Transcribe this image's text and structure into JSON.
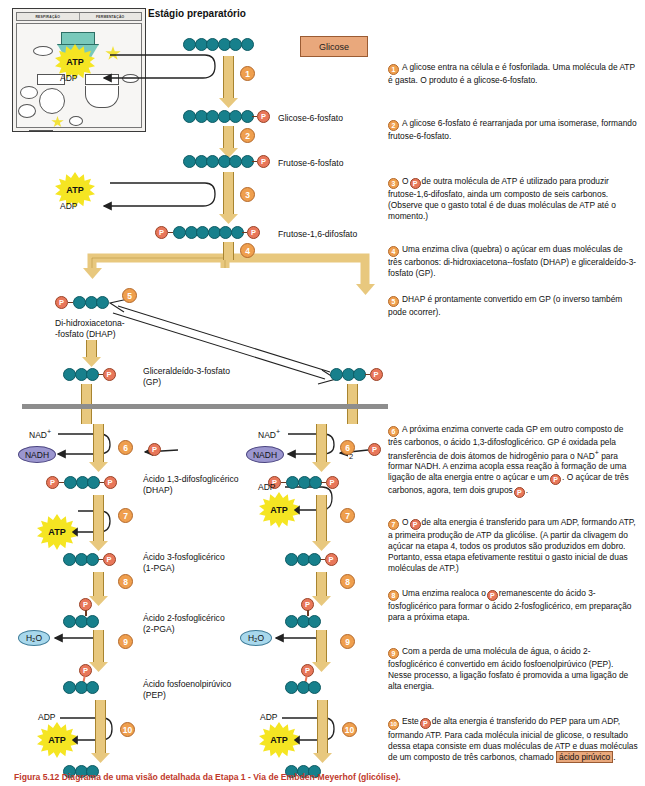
{
  "inset": {
    "headers": [
      "RESPIRAÇÃO",
      "FERMENTAÇÃO"
    ],
    "nodes": [
      {
        "label": "Moléculas\nGlicose"
      },
      {
        "label": "Ácido pirúvico"
      },
      {
        "label": "CO2"
      },
      {
        "label": "Acetil-CoA"
      },
      {
        "label": "Ciclo de\nKrebs"
      },
      {
        "label": "NADH\nFADH2"
      },
      {
        "label": "NADH\nFADH2"
      },
      {
        "label": "NADH"
      },
      {
        "label": "Ácido láctico\nou etanol"
      },
      {
        "label": "Formação de\nprodutos finais da\nfermentação"
      },
      {
        "label": "Fermentação"
      },
      {
        "label": "Elétrons"
      },
      {
        "label": "O2"
      },
      {
        "label": "ATP"
      },
      {
        "label": "Cadeia de\ntransporte\nde elétrons\ne quimiosmose"
      }
    ]
  },
  "stage_title": "Estágio preparatório",
  "glicose_box": "Glicose",
  "molecules": {
    "glucose": "",
    "g6p": "Glicose-6-fosfato",
    "f6p": "Frutose-6-fosfato",
    "f16dp": "Frutose-1,6-difosfato",
    "dhap": "Di-hidroxiacetona-\n-fosfato (DHAP)",
    "gp": "Gliceraldeído-3-fosfato\n(GP)",
    "bpg": "Ácido 1,3-difosfoglicérico\n(DHAP)",
    "pga3": "Ácido 3-fosfoglicérico\n(1-PGA)",
    "pga2": "Ácido 2-fosfoglicérico\n(2-PGA)",
    "pep": "Ácido fosfoenolpirúvico\n(PEP)"
  },
  "cofactors": {
    "atp": "ATP",
    "adp": "ADP",
    "nad_plus": "NAD",
    "nad_plus_sup": "+",
    "nadh": "NADH",
    "water": "H₂O",
    "two": "2"
  },
  "steps": [
    "1",
    "2",
    "3",
    "4",
    "5",
    "6",
    "7",
    "8",
    "9",
    "10"
  ],
  "phosphate_glyph": "P",
  "notes": [
    {
      "num": "1",
      "text": "A glicose entra na célula e é fosforilada. Uma molécula de ATP é gasta. O produto é a glicose-6-fosfato."
    },
    {
      "num": "2",
      "text": "A glicose 6-fosfato é rearranjada por uma isomerase, formando frutose-6-fosfato."
    },
    {
      "num": "3",
      "text_a": "O",
      "text_b": "de outra molécula de ATP é utilizado para produzir frutose-1,6-difosfato, ainda um composto de seis carbonos. (Observe que o gasto total é de duas moléculas de ATP até o momento.)"
    },
    {
      "num": "4",
      "text": "Uma enzima cliva (quebra) o açúcar em duas moléculas de três carbonos: di-hidroxiacetona--fosfato (DHAP) e gliceraldeído-3-fosfato (GP)."
    },
    {
      "num": "5",
      "text": "DHAP é prontamente convertido em GP (o inverso também pode ocorrer)."
    },
    {
      "num": "6",
      "text_a": "A próxima enzima converte cada GP em outro composto de três carbonos, o ácido 1,3-difosfoglicérico. GP é oxidada pela transferência de dois átomos de hidrogênio para o NAD",
      "sup": "+",
      "text_b": "para formar NADH. A enzima acopla essa reação à formação de uma ligação de alta energia entre o açúcar e um",
      "text_c": ". O açúcar de três carbonos, agora, tem dois grupos",
      "text_d": "."
    },
    {
      "num": "7",
      "text_a": "O",
      "text_b": "de alta energia é transferido para um ADP, formando ATP, a primeira produção de ATP da glicólise. (A partir da clivagem do açúcar na etapa 4, todos os produtos são produzidos em dobro. Portanto, essa etapa efetivamente restitui o gasto inicial de duas moléculas de ATP.)"
    },
    {
      "num": "8",
      "text_a": "Uma enzima realoca o",
      "text_b": "remanescente do ácido 3-fosfoglicérico para formar o ácido 2-fosfoglicérico, em preparação para a próxima etapa."
    },
    {
      "num": "9",
      "text": "Com a perda de uma molécula de água, o ácido 2-fosfoglicérico é convertido em ácido fosfoenolpirúvico (PEP). Nesse processo, a ligação fosfato é promovida a uma ligação de alta energia."
    },
    {
      "num": "10",
      "text_a": "Este",
      "text_b": "de alta energia é transferido do PEP para um ADP, formando ATP. Para cada molécula inicial de glicose, o resultado dessa etapa consiste em duas moléculas de ATP e duas moléculas de um composto de três carbonos, chamado",
      "highlight": "ácido pirúvico",
      "text_c": "."
    }
  ],
  "caption": "Figura 5.12  Diagrama de uma visão detalhada da Etapa 1 - Via de Embden-Meyerhof (glicólise).",
  "colors": {
    "carbon": "#17808c",
    "phosphate": "#e8775a",
    "step_circle": "#ef9f4e",
    "arrow": "#e8c87e",
    "atp": "#f5e522",
    "nadh": "#9b96cf",
    "water": "#a8d8ec",
    "glucose_box": "#e9a87c",
    "membrane": "#8d8d8d",
    "caption": "#c0392b"
  }
}
